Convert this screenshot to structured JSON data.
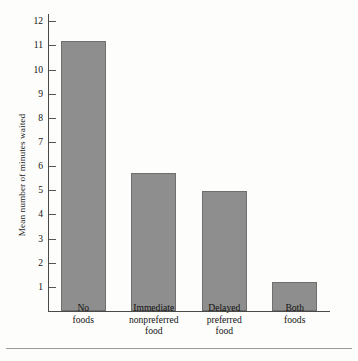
{
  "figure": {
    "background_color": "#fdfdfc",
    "bar_fill_color": "#8e8e8e",
    "bar_border_color": "#6f6f6f",
    "axis_color": "#4a4a4a",
    "rule_color": "#9a9a9a"
  },
  "chart_data": {
    "type": "bar",
    "title": "",
    "xlabel": "",
    "ylabel": "Mean number of minutes waited",
    "categories": [
      "No\nfoods",
      "Immediate\nnonpreferred\nfood",
      "Delayed\npreferred\nfood",
      "Both\nfoods"
    ],
    "category_lines": [
      [
        "No",
        "foods"
      ],
      [
        "Immediate",
        "nonpreferred",
        "food"
      ],
      [
        "Delayed",
        "preferred",
        "food"
      ],
      [
        "Both",
        "foods"
      ]
    ],
    "values": [
      11.2,
      5.7,
      4.95,
      1.2
    ],
    "ylim": [
      0,
      12.3
    ],
    "yticks": [
      1,
      2,
      3,
      4,
      5,
      6,
      7,
      8,
      9,
      10,
      11,
      12
    ],
    "ytick_labels": [
      "1",
      "2",
      "3",
      "4",
      "5",
      "6",
      "7",
      "8",
      "9",
      "10",
      "11",
      "12"
    ],
    "grid": false,
    "legend": null
  },
  "axis": {
    "y_title": "Mean number of minutes waited"
  }
}
